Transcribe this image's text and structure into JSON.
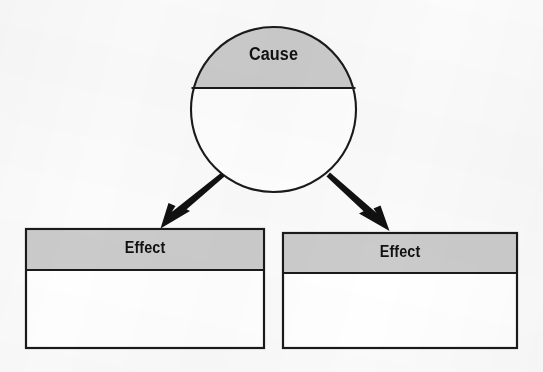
{
  "diagram": {
    "type": "cause-and-effect-graphic-organizer",
    "canvas": {
      "width": 543,
      "height": 372,
      "background_color": "#fbfbfb"
    },
    "style": {
      "shade_color": "#cbcbcb",
      "fill_color": "#ffffff",
      "stroke_color": "#1a1a1a",
      "text_color": "#111111"
    },
    "cause": {
      "label": "Cause",
      "shape": "circle",
      "center_x": 273,
      "center_y": 110,
      "radius": 83,
      "divider_y": 88,
      "header_shaded": true
    },
    "effects": [
      {
        "label": "Effect",
        "shape": "rectangle",
        "x": 25,
        "y": 228,
        "width": 240,
        "height": 121,
        "header_height": 42,
        "header_shaded": true
      },
      {
        "label": "Effect",
        "shape": "rectangle",
        "x": 282,
        "y": 232,
        "width": 236,
        "height": 117,
        "header_height": 41,
        "header_shaded": true
      }
    ],
    "connectors": [
      {
        "name": "arrow-cause-to-effect-left",
        "direction": "down-left",
        "from_x": 220,
        "from_y": 174,
        "to_x": 162,
        "to_y": 227
      },
      {
        "name": "arrow-cause-to-effect-right",
        "direction": "down-right",
        "from_x": 333,
        "from_y": 174,
        "to_x": 387,
        "to_y": 231
      }
    ]
  }
}
